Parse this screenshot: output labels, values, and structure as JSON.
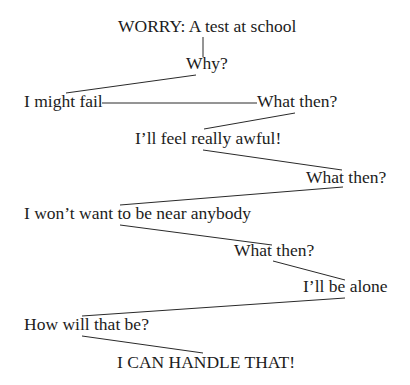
{
  "diagram": {
    "nodes": [
      {
        "id": "worry",
        "text": "WORRY: A test at school",
        "x": 118,
        "y": 18
      },
      {
        "id": "why",
        "text": "Why?",
        "x": 186,
        "y": 55
      },
      {
        "id": "fail",
        "text": "I might fail",
        "x": 24,
        "y": 93
      },
      {
        "id": "what-then-1",
        "text": "What then?",
        "x": 257,
        "y": 93
      },
      {
        "id": "awful",
        "text": "I’ll feel really awful!",
        "x": 135,
        "y": 130
      },
      {
        "id": "what-then-2",
        "text": "What then?",
        "x": 306,
        "y": 169
      },
      {
        "id": "anybody",
        "text": "I won’t want to be near anybody",
        "x": 24,
        "y": 205
      },
      {
        "id": "what-then-3",
        "text": "What then?",
        "x": 234,
        "y": 242
      },
      {
        "id": "alone",
        "text": "I’ll be alone",
        "x": 303,
        "y": 278
      },
      {
        "id": "how",
        "text": "How will that be?",
        "x": 24,
        "y": 316
      },
      {
        "id": "handle",
        "text": "I CAN HANDLE THAT!",
        "x": 117,
        "y": 354
      }
    ],
    "edges": [
      {
        "from": "worry",
        "to": "why",
        "x1": 203,
        "y1": 37,
        "x2": 203,
        "y2": 57
      },
      {
        "from": "why",
        "to": "fail",
        "x1": 196,
        "y1": 75,
        "x2": 66,
        "y2": 93
      },
      {
        "from": "fail",
        "to": "what-then-1",
        "x1": 102,
        "y1": 103,
        "x2": 257,
        "y2": 103
      },
      {
        "from": "what-then-1",
        "to": "awful",
        "x1": 295,
        "y1": 113,
        "x2": 204,
        "y2": 129
      },
      {
        "from": "awful",
        "to": "what-then-2",
        "x1": 203,
        "y1": 150,
        "x2": 342,
        "y2": 170
      },
      {
        "from": "what-then-2",
        "to": "anybody",
        "x1": 343,
        "y1": 187,
        "x2": 120,
        "y2": 205
      },
      {
        "from": "anybody",
        "to": "what-then-3",
        "x1": 120,
        "y1": 225,
        "x2": 272,
        "y2": 245
      },
      {
        "from": "what-then-3",
        "to": "alone",
        "x1": 273,
        "y1": 261,
        "x2": 345,
        "y2": 280
      },
      {
        "from": "alone",
        "to": "how",
        "x1": 345,
        "y1": 298,
        "x2": 82,
        "y2": 316
      },
      {
        "from": "how",
        "to": "handle",
        "x1": 82,
        "y1": 336,
        "x2": 203,
        "y2": 353
      }
    ],
    "colors": {
      "text": "#1c1c1c",
      "line": "#2a2a2a",
      "background": "#ffffff"
    }
  }
}
